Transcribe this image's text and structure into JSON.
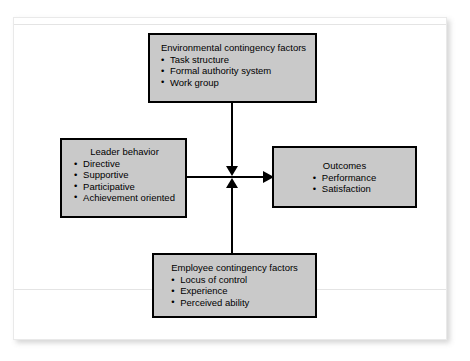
{
  "diagram": {
    "type": "flow-model",
    "nodes": [
      {
        "id": "environmental",
        "title": "Environmental contingency factors",
        "items": [
          "Task structure",
          "Formal authority system",
          "Work group"
        ]
      },
      {
        "id": "leader",
        "title": "Leader behavior",
        "items": [
          "Directive",
          "Supportive",
          "Participative",
          "Achievement oriented"
        ]
      },
      {
        "id": "outcomes",
        "title": "Outcomes",
        "items": [
          "Performance",
          "Satisfaction"
        ]
      },
      {
        "id": "employee",
        "title": "Employee contingency factors",
        "items": [
          "Locus of control",
          "Experience",
          "Perceived ability"
        ]
      }
    ],
    "connectors": [
      {
        "id": "environmental-to-junction",
        "from": "environmental",
        "to": "junction",
        "direction": "down"
      },
      {
        "id": "employee-to-junction",
        "from": "employee",
        "to": "junction",
        "direction": "up"
      },
      {
        "id": "leader-to-outcomes",
        "from": "leader",
        "to": "outcomes",
        "direction": "right"
      }
    ],
    "colors": {
      "box_fill": "#c9c9c9",
      "box_border": "#000000",
      "connector": "#000000",
      "page_background": "#ffffff"
    }
  }
}
